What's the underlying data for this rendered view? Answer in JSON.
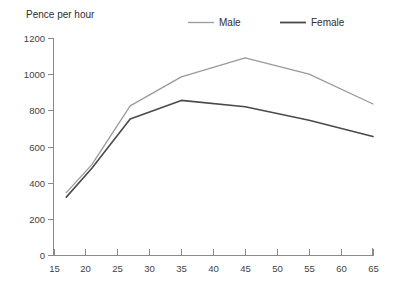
{
  "chart_data": {
    "type": "line",
    "title": "",
    "ylabel": "Pence per hour",
    "xlabel": "",
    "xlim": [
      15,
      65
    ],
    "ylim": [
      0,
      1200
    ],
    "grid": false,
    "legend_position": "top-center",
    "x_ticks": [
      15,
      20,
      25,
      30,
      35,
      40,
      45,
      50,
      55,
      60,
      65
    ],
    "y_ticks": [
      0,
      200,
      400,
      600,
      800,
      1000,
      1200
    ],
    "series": [
      {
        "name": "Male",
        "color": "#9a9a9a",
        "x": [
          17,
          21,
          27,
          35,
          45,
          55,
          65
        ],
        "values": [
          345,
          500,
          825,
          985,
          1090,
          1000,
          835
        ]
      },
      {
        "name": "Female",
        "color": "#4a4a4a",
        "x": [
          17,
          21,
          27,
          35,
          45,
          55,
          65
        ],
        "values": [
          320,
          480,
          752,
          855,
          820,
          745,
          655
        ]
      }
    ]
  },
  "axis": {
    "y_title": "Pence per hour"
  },
  "legend": {
    "items": [
      {
        "label": "Male",
        "color": "#9a9a9a"
      },
      {
        "label": "Female",
        "color": "#4a4a4a"
      }
    ]
  }
}
